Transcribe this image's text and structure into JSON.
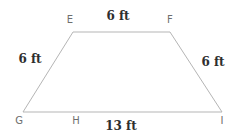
{
  "figure": {
    "type": "trapezoid",
    "unit": "ft",
    "colors": {
      "line": "#b5b5b5",
      "vertex_text": "#6e6e6e",
      "measure_text": "#2e2e2e",
      "background": "#ffffff"
    },
    "vertices": [
      {
        "name": "E",
        "x": 73,
        "y": 32,
        "label": "E",
        "label_x": 70,
        "label_y": 20
      },
      {
        "name": "F",
        "x": 170,
        "y": 32,
        "label": "F",
        "label_x": 170,
        "label_y": 20
      },
      {
        "name": "G",
        "x": 23,
        "y": 112,
        "label": "G",
        "label_x": 19,
        "label_y": 121
      },
      {
        "name": "H",
        "x": 76,
        "y": 112,
        "label": "H",
        "label_x": 76,
        "label_y": 121
      },
      {
        "name": "I",
        "x": 222,
        "y": 112,
        "label": "I",
        "label_x": 222,
        "label_y": 121
      }
    ],
    "edges": [
      {
        "name": "EF",
        "from": "E",
        "to": "F",
        "length": "6 ft"
      },
      {
        "name": "GE",
        "from": "G",
        "to": "E",
        "length": "6 ft"
      },
      {
        "name": "FI",
        "from": "F",
        "to": "I",
        "length": "6 ft"
      },
      {
        "name": "GI",
        "from": "G",
        "to": "I",
        "length": "13 ft"
      }
    ],
    "measure_labels": [
      {
        "edge": "EF",
        "text": "6 ft",
        "x": 118,
        "y": 16
      },
      {
        "edge": "GE",
        "text": "6 ft",
        "x": 30,
        "y": 59
      },
      {
        "edge": "FI",
        "text": "6 ft",
        "x": 213,
        "y": 62
      },
      {
        "edge": "GI",
        "text": "13 ft",
        "x": 121,
        "y": 126
      }
    ]
  }
}
